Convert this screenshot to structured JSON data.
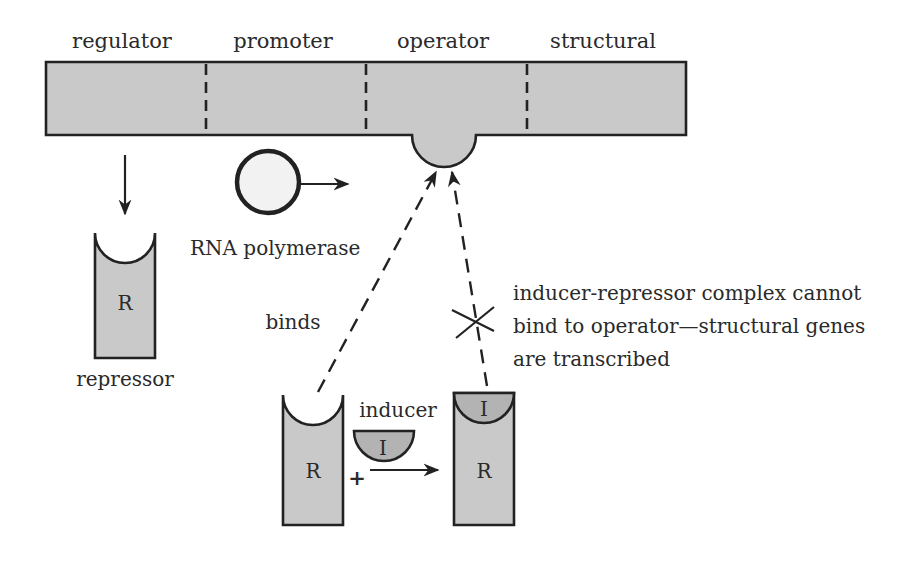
{
  "diagram": {
    "gene_regions": [
      {
        "id": "regulator",
        "label": "regulator"
      },
      {
        "id": "promoter",
        "label": "promoter"
      },
      {
        "id": "operator",
        "label": "operator"
      },
      {
        "id": "structural",
        "label": "structural"
      }
    ],
    "rna_polymerase": {
      "label": "RNA polymerase"
    },
    "repressor": {
      "symbol": "R",
      "label": "repressor"
    },
    "binding": {
      "label": "binds"
    },
    "reaction": {
      "repressor_symbol": "R",
      "plus": "+",
      "inducer_label": "inducer",
      "inducer_symbol": "I",
      "complex_repressor_symbol": "R",
      "complex_inducer_symbol": "I"
    },
    "blocked_note": {
      "lines": [
        "inducer-repressor complex cannot",
        "bind to operator—structural genes",
        "are transcribed"
      ]
    },
    "colors": {
      "fill": "#c9c9c9",
      "inducer_fill": "#b3b3b3",
      "stroke": "#222222",
      "text": "#2a2a2a"
    }
  }
}
